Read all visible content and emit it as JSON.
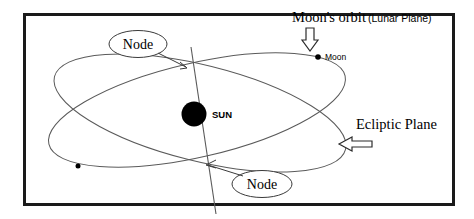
{
  "figure": {
    "type": "astronomy-orbital-diagram",
    "background_color": "#ffffff",
    "frame": {
      "stroke_color": "#1a1a1a",
      "stroke_width": 3,
      "x": 23,
      "y": 13,
      "width": 430,
      "height": 192
    },
    "stroke_color": "#555555",
    "labels": {
      "moons_orbit": "Moon's orbit",
      "lunar_plane": "(Lunar Plane)",
      "moon": "Moon",
      "sun": "SUN",
      "ecliptic_plane": "Ecliptic Plane",
      "node_top": "Node",
      "node_bottom": "Node"
    },
    "bodies": [
      {
        "name": "sun",
        "label": "SUN",
        "cx": 194,
        "cy": 114,
        "r": 12.5,
        "fill": "#000000"
      },
      {
        "name": "moon",
        "label": "Moon",
        "cx": 318,
        "cy": 57,
        "r": 2.6,
        "fill": "#000000"
      },
      {
        "name": "moon-second-position",
        "label": "",
        "cx": 78,
        "cy": 166,
        "r": 2.4,
        "fill": "#000000"
      }
    ],
    "orbits": [
      {
        "name": "lunar-orbit-ellipse",
        "cx": 197,
        "cy": 110,
        "rx": 152,
        "ry": 47,
        "rotation_deg": -13
      },
      {
        "name": "ecliptic-plane-ellipse",
        "cx": 200,
        "cy": 113,
        "rx": 150,
        "ry": 48,
        "rotation_deg": 14
      }
    ],
    "node_line": {
      "name": "line-of-nodes",
      "x1": 191,
      "y1": 47,
      "x2": 216,
      "y2": 214
    },
    "callouts": [
      {
        "name": "node-top",
        "ellipse_cx": 138,
        "ellipse_cy": 44,
        "rx": 29,
        "ry": 13
      },
      {
        "name": "node-bottom",
        "ellipse_cx": 262,
        "ellipse_cy": 184,
        "rx": 30,
        "ry": 13
      }
    ],
    "block_arrows": [
      {
        "name": "moons-orbit-arrow",
        "direction": "down"
      },
      {
        "name": "ecliptic-plane-arrow",
        "direction": "left"
      }
    ]
  }
}
